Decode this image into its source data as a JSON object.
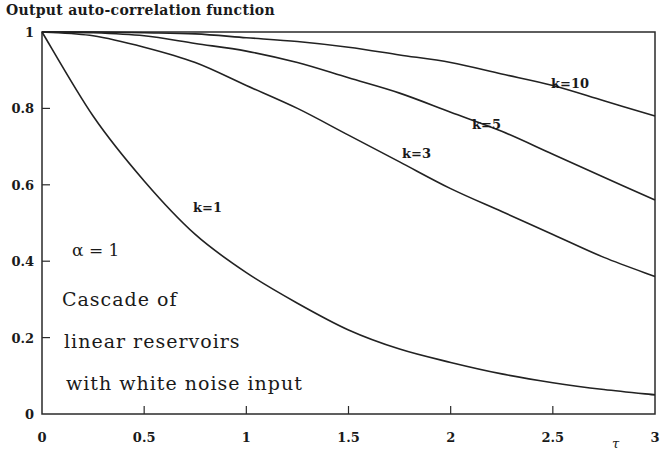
{
  "chart_data": {
    "type": "line",
    "title": "Output auto-correlation function",
    "xlabel": "τ",
    "ylabel": "",
    "xlim": [
      0,
      3
    ],
    "ylim": [
      0,
      1
    ],
    "grid": false,
    "x_ticks": [
      "0",
      "0.5",
      "1",
      "1.5",
      "2",
      "2.5",
      "3"
    ],
    "y_ticks": [
      "0",
      "0.2",
      "0.4",
      "0.6",
      "0.8",
      "1"
    ],
    "x": [
      0,
      0.25,
      0.5,
      0.75,
      1.0,
      1.25,
      1.5,
      1.75,
      2.0,
      2.25,
      2.5,
      2.75,
      3.0
    ],
    "series": [
      {
        "name": "k=1",
        "values": [
          1.0,
          0.78,
          0.61,
          0.47,
          0.37,
          0.29,
          0.22,
          0.17,
          0.135,
          0.105,
          0.082,
          0.064,
          0.05
        ]
      },
      {
        "name": "k=3",
        "values": [
          1.0,
          0.99,
          0.96,
          0.92,
          0.86,
          0.8,
          0.73,
          0.66,
          0.59,
          0.53,
          0.47,
          0.41,
          0.36
        ]
      },
      {
        "name": "k=5",
        "values": [
          1.0,
          0.998,
          0.99,
          0.97,
          0.95,
          0.92,
          0.88,
          0.84,
          0.79,
          0.74,
          0.68,
          0.62,
          0.56
        ]
      },
      {
        "name": "k=10",
        "values": [
          1.0,
          1.0,
          0.998,
          0.995,
          0.985,
          0.975,
          0.96,
          0.94,
          0.92,
          0.89,
          0.86,
          0.82,
          0.78
        ]
      }
    ],
    "annotations": [
      "k=1",
      "k=3",
      "k=5",
      "k=10",
      "α = 1",
      "Cascade of",
      "linear reservoirs",
      "with white noise input"
    ],
    "legend": "none (curves labeled inline)"
  },
  "labels": {
    "title": "Output auto-correlation function",
    "alpha": "α  =  1",
    "caption_line1": "Cascade of",
    "caption_line2": "linear reservoirs",
    "caption_line3": "with white noise input",
    "xlabel": "τ",
    "k1": "k=1",
    "k3": "k=3",
    "k5": "k=5",
    "k10": "k=10"
  }
}
